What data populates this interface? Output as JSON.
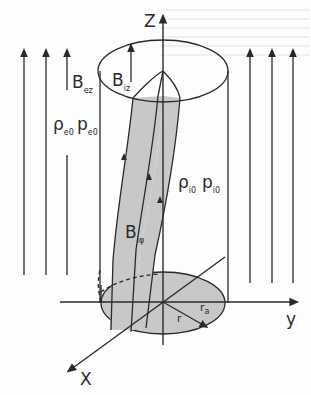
{
  "diagram": {
    "axes": {
      "z": "Z",
      "y": "y",
      "x": "X"
    },
    "labels": {
      "external_field": {
        "main": "B",
        "sub": "ez"
      },
      "internal_axial_field": {
        "main": "B",
        "sub": "iz"
      },
      "internal_azimuthal_field": {
        "main": "B",
        "sub": "iφ"
      },
      "external_density": {
        "main": "ρ",
        "sub": "e0"
      },
      "external_pressure": {
        "main": "p",
        "sub": "e0"
      },
      "internal_density": {
        "main": "ρ",
        "sub": "i0"
      },
      "internal_pressure": {
        "main": "p",
        "sub": "i0"
      },
      "radius": "r",
      "tube_radius": {
        "main": "r",
        "sub": "a"
      }
    },
    "colors": {
      "line": "#2a2a2a",
      "tube_fill": "#c8c8c8",
      "base_fill": "#c8c8c8",
      "background": "#fdfdfd"
    }
  }
}
